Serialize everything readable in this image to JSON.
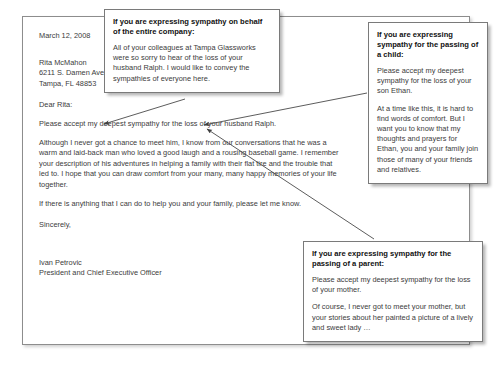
{
  "letter": {
    "date": "March 12, 2008",
    "recipient": [
      "Rita McMahon",
      "6211 S. Damen Ave.",
      "Tampa, FL 48853"
    ],
    "salutation": "Dear Rita:",
    "opening": "Please accept my deepest sympathy for the loss of your husband Ralph.",
    "body_paragraph": "Although I never got a chance to meet him, I know from our conversations that he was a warm and laid-back man who loved a good laugh and a rousing baseball game. I remember your description of his adventures in helping a family with their flat tire and the trouble that led to. I hope that you can draw comfort from your many, many happy memories of your life together.",
    "closing_paragraph": "If there is anything that I can do to help you and your family, please let me know.",
    "sign_off": "Sincerely,",
    "signer_name": "Ivan Petrovic",
    "signer_title": "President and Chief Executive Officer"
  },
  "callouts": [
    {
      "id": "company",
      "title": "If you are expressing sympathy on behalf of the entire company:",
      "paragraphs": [
        "All of your colleagues at Tampa Glassworks were so sorry to hear of the loss of your husband Ralph. I would like to convey the sympathies of everyone here."
      ]
    },
    {
      "id": "child",
      "title": "If you are expressing sympathy for the passing of a child:",
      "paragraphs": [
        "Please accept my deepest sympathy for the loss of your son Ethan.",
        "At a time like this, it is hard to find words of comfort. But I want you to know that my thoughts and prayers for Ethan, you and your family join those of many of your friends and relatives."
      ]
    },
    {
      "id": "parent",
      "title": "If you are expressing sympathy for the passing of a parent:",
      "paragraphs": [
        "Please accept my deepest sympathy for the loss of your mother.",
        "Of course, I never got to meet your mother, but your stories about her painted a picture of a lively and sweet lady …"
      ]
    }
  ],
  "colors": {
    "page_border": "#8d8d8d",
    "callout_border": "#7a7a7a",
    "body_text": "#3b3b3b",
    "title_text": "#111111",
    "leader_line": "#4a4a4a"
  }
}
